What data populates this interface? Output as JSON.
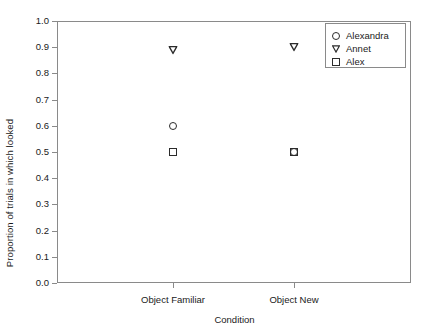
{
  "chart_data": {
    "type": "scatter",
    "title": "",
    "xlabel": "Condition",
    "ylabel": "Proportion of trials in which looked",
    "categories": [
      "Object Familiar",
      "Object New"
    ],
    "ylim": [
      0.0,
      1.0
    ],
    "ytick_labels": [
      "0.0",
      "0.1",
      "0.2",
      "0.3",
      "0.4",
      "0.5",
      "0.6",
      "0.7",
      "0.8",
      "0.9",
      "1.0"
    ],
    "ytick_values": [
      0.0,
      0.1,
      0.2,
      0.3,
      0.4,
      0.5,
      0.6,
      0.7,
      0.8,
      0.9,
      1.0
    ],
    "grid": false,
    "legend_position": "top-right",
    "series": [
      {
        "name": "Alexandra",
        "marker": "circle",
        "values": [
          0.6,
          0.5
        ]
      },
      {
        "name": "Annet",
        "marker": "triangle-down",
        "values": [
          0.89,
          0.9
        ]
      },
      {
        "name": "Alex",
        "marker": "square",
        "values": [
          0.5,
          0.5
        ]
      }
    ],
    "points": [
      {
        "series": "Annet",
        "category": "Object Familiar",
        "value": 0.89
      },
      {
        "series": "Alexandra",
        "category": "Object Familiar",
        "value": 0.6
      },
      {
        "series": "Alex",
        "category": "Object Familiar",
        "value": 0.5
      },
      {
        "series": "Annet",
        "category": "Object New",
        "value": 0.9
      },
      {
        "series": "Alexandra",
        "category": "Object New",
        "value": 0.5
      },
      {
        "series": "Alex",
        "category": "Object New",
        "value": 0.5
      }
    ],
    "colors": {
      "marker": "#2b2b2b",
      "axis": "#8a8a8a",
      "text": "#1a1a1a",
      "background": "#ffffff"
    }
  },
  "legend": {
    "entries": [
      {
        "label": "Alexandra",
        "icon": "circle-marker-icon"
      },
      {
        "label": "Annet",
        "icon": "triangle-down-marker-icon"
      },
      {
        "label": "Alex",
        "icon": "square-marker-icon"
      }
    ]
  }
}
